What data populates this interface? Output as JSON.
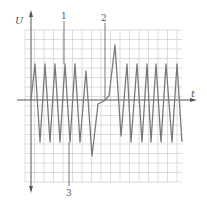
{
  "figure": {
    "axis_labels": {
      "y": "U",
      "x": "t"
    },
    "markers": [
      {
        "id": "1",
        "label": "1"
      },
      {
        "id": "2",
        "label": "2"
      },
      {
        "id": "3",
        "label": "3"
      }
    ],
    "colors": {
      "grid": "#c9c9c9",
      "axis": "#555555",
      "wave": "#7a7a7a",
      "background": "#ffffff"
    }
  },
  "chart_data": {
    "type": "line",
    "title": "",
    "xlabel": "t",
    "ylabel": "U",
    "grid": true,
    "points_px": [
      [
        31,
        100
      ],
      [
        35,
        64
      ],
      [
        40,
        142
      ],
      [
        45,
        64
      ],
      [
        50,
        142
      ],
      [
        55,
        64
      ],
      [
        60,
        142
      ],
      [
        65,
        64
      ],
      [
        70,
        142
      ],
      [
        75,
        64
      ],
      [
        80,
        142
      ],
      [
        86,
        71
      ],
      [
        92,
        156
      ],
      [
        98,
        104
      ],
      [
        104,
        101
      ],
      [
        109,
        96
      ],
      [
        115,
        45
      ],
      [
        121,
        136
      ],
      [
        127,
        64
      ],
      [
        131,
        142
      ],
      [
        137,
        64
      ],
      [
        142,
        142
      ],
      [
        147,
        64
      ],
      [
        151,
        142
      ],
      [
        156,
        64
      ],
      [
        161,
        142
      ],
      [
        166,
        64
      ],
      [
        172,
        142
      ],
      [
        177,
        64
      ],
      [
        182,
        142
      ]
    ]
  }
}
